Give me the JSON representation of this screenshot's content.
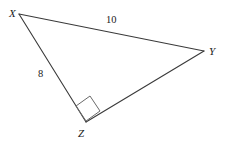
{
  "figure": {
    "type": "geometry-diagram",
    "shape": "right-triangle",
    "background_color": "#ffffff",
    "stroke_color": "#3a3a3a",
    "text_color": "#1a1a1a",
    "stroke_width": 1,
    "vertices": {
      "X": {
        "label": "X",
        "x": 19,
        "y": 14,
        "label_x": 9,
        "label_y": 8
      },
      "Y": {
        "label": "Y",
        "x": 204,
        "y": 51,
        "label_x": 209,
        "label_y": 46
      },
      "Z": {
        "label": "Z",
        "x": 86,
        "y": 122,
        "label_x": 78,
        "label_y": 128
      }
    },
    "sides": [
      {
        "name": "XY",
        "label": "10",
        "from": "X",
        "to": "Y",
        "label_x": 106,
        "label_y": 15
      },
      {
        "name": "XZ",
        "label": "8",
        "from": "X",
        "to": "Z",
        "label_x": 38,
        "label_y": 69
      },
      {
        "name": "ZY",
        "label": "",
        "from": "Z",
        "to": "Y",
        "label_x": 0,
        "label_y": 0
      }
    ],
    "right_angle": {
      "at_vertex": "Z",
      "marker": "square",
      "points": "86,121 76,106 90,96 100,111"
    },
    "polygon_points": "19,14 204,51 86,122"
  }
}
